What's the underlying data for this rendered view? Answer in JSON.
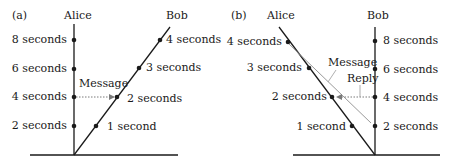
{
  "panels": [
    {
      "id": "a",
      "tag": "(a)",
      "observers": {
        "left": "Alice",
        "right": "Bob"
      },
      "left_ticks": [
        "8 seconds",
        "6 seconds",
        "4 seconds",
        "2 seconds"
      ],
      "right_ticks": [
        "4 seconds",
        "3 seconds",
        "2 seconds",
        "1 second"
      ],
      "arrows": {
        "message": "Message"
      }
    },
    {
      "id": "b",
      "tag": "(b)",
      "observers": {
        "left": "Alice",
        "right": "Bob"
      },
      "left_ticks": [
        "4 seconds",
        "3 seconds",
        "2 seconds",
        "1 second"
      ],
      "right_ticks": [
        "8 seconds",
        "6 seconds",
        "4 seconds",
        "2 seconds"
      ],
      "arrows": {
        "message": "Message",
        "reply": "Reply"
      }
    }
  ],
  "colors": {
    "line": "#1a1a1a",
    "message_line": "#9a9a9a",
    "dotted_arrow": "#7a7a7a"
  }
}
